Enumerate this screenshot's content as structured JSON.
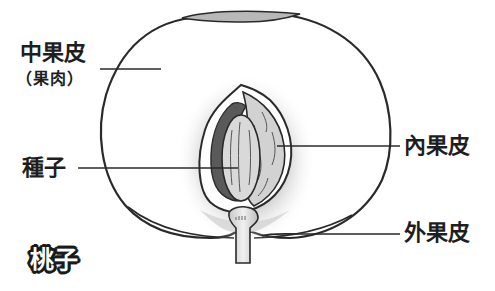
{
  "diagram": {
    "title": "桃子",
    "labels": {
      "mesocarp": "中果皮",
      "mesocarp_note": "（果肉）",
      "seed": "種子",
      "endocarp": "內果皮",
      "exocarp": "外果皮"
    },
    "colors": {
      "outline": "#2a2a2a",
      "flesh": "#ffffff",
      "stone_shadow": "#6a6a6a",
      "pit_surface": "#d4d4d4",
      "seed": "#dcdcdc",
      "cavity_dark": "#5a5a5a",
      "skin_patch": "#b4b4b4",
      "stem": "#e2e2e2"
    }
  }
}
